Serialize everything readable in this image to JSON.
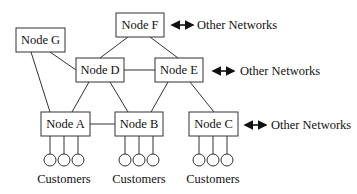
{
  "diagram": {
    "type": "network-topology",
    "nodes": {
      "F": {
        "label": "Node F"
      },
      "G": {
        "label": "Node G"
      },
      "D": {
        "label": "Node D"
      },
      "E": {
        "label": "Node E"
      },
      "A": {
        "label": "Node A"
      },
      "B": {
        "label": "Node B"
      },
      "C": {
        "label": "Node C"
      }
    },
    "edges": [
      [
        "F",
        "D"
      ],
      [
        "F",
        "E"
      ],
      [
        "G",
        "D"
      ],
      [
        "G",
        "A"
      ],
      [
        "D",
        "E"
      ],
      [
        "D",
        "A"
      ],
      [
        "D",
        "B"
      ],
      [
        "E",
        "B"
      ],
      [
        "E",
        "C"
      ],
      [
        "A",
        "B"
      ]
    ],
    "external_links": {
      "F": "Other Networks",
      "E": "Other Networks",
      "C": "Other Networks"
    },
    "customers": {
      "A": {
        "label": "Customers",
        "count": 3
      },
      "B": {
        "label": "Customers",
        "count": 3
      },
      "C": {
        "label": "Customers",
        "count": 3
      }
    }
  }
}
